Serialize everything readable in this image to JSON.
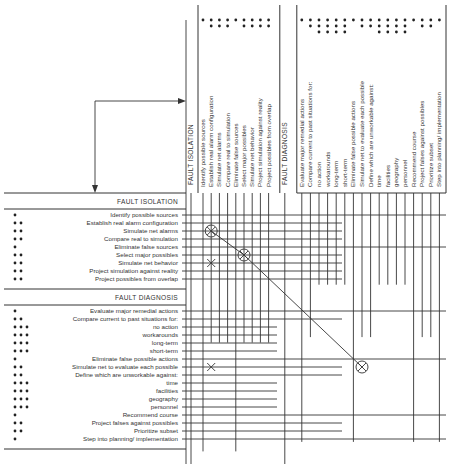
{
  "colors": {
    "ink": "#333333",
    "background": "#ffffff"
  },
  "sections": {
    "fault_isolation": {
      "label": "FAULT ISOLATION",
      "items": [
        {
          "label": "Identify possible sources",
          "level": 1
        },
        {
          "label": "Establish real alarm configuration",
          "level": 2
        },
        {
          "label": "Simulate net alarms",
          "level": 2
        },
        {
          "label": "Compare real to simulation",
          "level": 2
        },
        {
          "label": "Eliminate false sources",
          "level": 1
        },
        {
          "label": "Select major possibles",
          "level": 2
        },
        {
          "label": "Simulate net behavior",
          "level": 2
        },
        {
          "label": "Project simulation against reality",
          "level": 2
        },
        {
          "label": "Project possibles from overlap",
          "level": 2
        }
      ]
    },
    "fault_diagnosis": {
      "label": "FAULT DIAGNOSIS",
      "items": [
        {
          "label": "Evaluate major remedial actions",
          "level": 1
        },
        {
          "label": "Compare current to past situations for:",
          "level": 2
        },
        {
          "label": "no action",
          "level": 3
        },
        {
          "label": "workarounds",
          "level": 3
        },
        {
          "label": "long-term",
          "level": 3
        },
        {
          "label": "short-term",
          "level": 3
        },
        {
          "label": "Eliminate false possible actions",
          "level": 1
        },
        {
          "label": "Simulate net to evaluate each possible",
          "level": 2
        },
        {
          "label": "Define which are unworkable against:",
          "level": 2
        },
        {
          "label": "time",
          "level": 3
        },
        {
          "label": "facilities",
          "level": 3
        },
        {
          "label": "geography",
          "level": 3
        },
        {
          "label": "personnel",
          "level": 3
        },
        {
          "label": "Recommend course",
          "level": 1
        },
        {
          "label": "Project falses against possibles",
          "level": 2
        },
        {
          "label": "Prioritize subset",
          "level": 2
        },
        {
          "label": "Step into planning/ implementation",
          "level": 1
        }
      ]
    }
  },
  "marks": {
    "circled_x": [
      {
        "row": "Simulate net alarms",
        "col": "Establish real alarm configuration"
      },
      {
        "row": "Select major possibles",
        "col": "Select major possibles"
      },
      {
        "row": "Simulate net to evaluate each possible",
        "col": "Simulate net to evaluate each possible"
      }
    ],
    "x": [
      {
        "row": "Simulate net behavior",
        "col": "Establish real alarm configuration"
      },
      {
        "row": "Simulate net to evaluate each possible",
        "col": "Establish real alarm configuration"
      }
    ]
  },
  "legend": {
    "dot_meaning": "hierarchy level (number of dots)"
  }
}
